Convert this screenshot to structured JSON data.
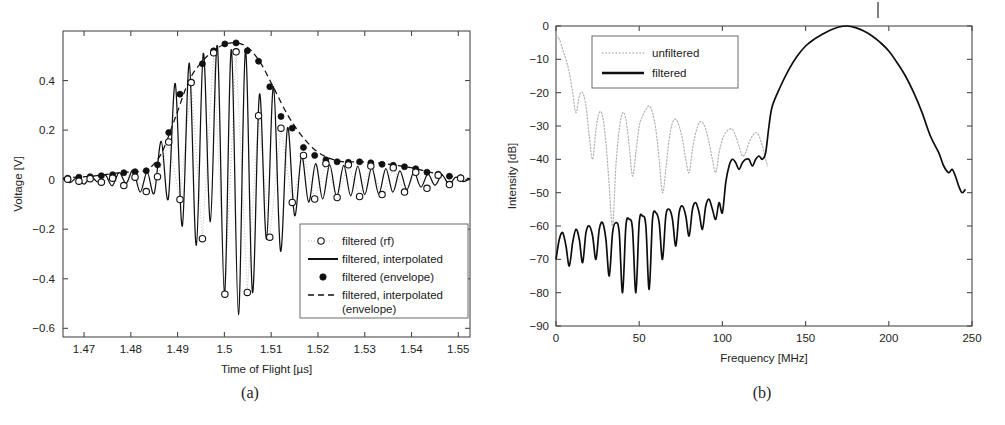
{
  "figure": {
    "panels": [
      {
        "id": "a",
        "caption": "(a)"
      },
      {
        "id": "b",
        "caption": "(b)"
      }
    ]
  },
  "panel_a": {
    "caption": "(a)",
    "xlabel": "Time of Flight [µs]",
    "ylabel": "Voltage [V]",
    "xticks": [
      "1.47",
      "1.48",
      "1.49",
      "1.5",
      "1.51",
      "1.52",
      "1.53",
      "1.54",
      "1.55"
    ],
    "yticks": [
      "0.4",
      "0.2",
      "0",
      "−0.2",
      "−0.4",
      "−0.6"
    ],
    "legend": {
      "items": [
        {
          "label": "filtered (rf)",
          "style": "dotted-with-open-circle"
        },
        {
          "label": "filtered, interpolated",
          "style": "solid"
        },
        {
          "label": "filtered (envelope)",
          "style": "filled-circle"
        },
        {
          "label": "filtered, interpolated",
          "style": "dashed"
        },
        {
          "label": "(envelope)",
          "style": "continuation"
        }
      ]
    }
  },
  "panel_b": {
    "caption": "(b)",
    "xlabel": "Frequency [MHz]",
    "ylabel": "Intensity [dB]",
    "xticks": [
      "0",
      "50",
      "100",
      "150",
      "200",
      "250"
    ],
    "yticks": [
      "0",
      "−10",
      "−20",
      "−30",
      "−40",
      "−50",
      "−60",
      "−70",
      "−80",
      "−90"
    ],
    "legend": {
      "items": [
        {
          "label": "unfiltered",
          "style": "dotted"
        },
        {
          "label": "filtered",
          "style": "solid"
        }
      ]
    }
  },
  "colors": {
    "ink": "#111111",
    "axis": "#4a4a4a",
    "dotted_gray": "#b0b0b0",
    "background": "#ffffff"
  },
  "chart_data": [
    {
      "type": "line",
      "panel": "a",
      "title": "",
      "xlabel": "Time of Flight [µs]",
      "ylabel": "Voltage [V]",
      "xlim": [
        1.4655,
        1.5525
      ],
      "ylim": [
        -0.635,
        0.6
      ],
      "xticks": [
        1.47,
        1.48,
        1.49,
        1.5,
        1.51,
        1.52,
        1.53,
        1.54,
        1.55
      ],
      "yticks": [
        0.4,
        0.2,
        0,
        -0.2,
        -0.4,
        -0.6
      ],
      "grid": false,
      "legend_position": "lower-right",
      "series": [
        {
          "name": "filtered, interpolated",
          "style": "solid",
          "comment": "densely sampled interpolated rf waveform: gaussian-windowed ~125 MHz tone centred at 1.5025 us",
          "x": [
            1.4655,
            1.467,
            1.4685,
            1.47,
            1.4715,
            1.473,
            1.4745,
            1.476,
            1.4775,
            1.479,
            1.4805,
            1.482,
            1.4835,
            1.485,
            1.4865,
            1.488,
            1.4895,
            1.491,
            1.4925,
            1.494,
            1.4955,
            1.497,
            1.4985,
            1.5,
            1.5015,
            1.503,
            1.5045,
            1.506,
            1.5075,
            1.509,
            1.5105,
            1.512,
            1.5135,
            1.515,
            1.5165,
            1.518,
            1.5195,
            1.521,
            1.5225,
            1.524,
            1.5255,
            1.527,
            1.5285,
            1.53,
            1.5315,
            1.533,
            1.5345,
            1.536,
            1.5375,
            1.539,
            1.5405,
            1.542,
            1.5435,
            1.545,
            1.5465,
            1.548,
            1.5495,
            1.551,
            1.5525
          ],
          "y": [
            0.005,
            -0.012,
            0.008,
            -0.018,
            0.012,
            -0.01,
            0.02,
            -0.025,
            0.028,
            -0.015,
            0.038,
            -0.05,
            0.03,
            -0.055,
            0.155,
            -0.078,
            0.388,
            -0.188,
            0.47,
            -0.265,
            0.51,
            -0.17,
            0.54,
            -0.46,
            0.525,
            -0.545,
            0.52,
            -0.455,
            0.345,
            -0.24,
            0.375,
            -0.288,
            0.21,
            -0.145,
            0.095,
            -0.09,
            0.065,
            -0.078,
            0.06,
            -0.07,
            0.058,
            -0.065,
            0.055,
            -0.06,
            0.05,
            -0.058,
            0.045,
            -0.05,
            0.035,
            -0.04,
            0.03,
            -0.03,
            0.022,
            -0.022,
            0.018,
            -0.018,
            0.01,
            -0.008,
            0.004
          ]
        },
        {
          "name": "filtered (rf)",
          "style": "open-circle-markers",
          "comment": "sparsely sampled rf points (open circles), ~every 2.4 ns",
          "x": [
            1.4665,
            1.4689,
            1.4713,
            1.4737,
            1.4761,
            1.4785,
            1.4809,
            1.4833,
            1.4857,
            1.4881,
            1.4905,
            1.4929,
            1.4953,
            1.4977,
            1.5001,
            1.5025,
            1.5049,
            1.5073,
            1.5097,
            1.5121,
            1.5145,
            1.5169,
            1.5193,
            1.5217,
            1.5241,
            1.5265,
            1.5289,
            1.5313,
            1.5337,
            1.5361,
            1.5385,
            1.5409,
            1.5433,
            1.5457,
            1.5481,
            1.5505
          ],
          "y": [
            0.002,
            -0.006,
            0.004,
            -0.01,
            0.006,
            -0.024,
            0.01,
            -0.048,
            0.012,
            0.152,
            -0.08,
            0.392,
            -0.238,
            0.512,
            -0.462,
            0.516,
            -0.455,
            0.258,
            -0.232,
            0.208,
            -0.092,
            0.098,
            -0.078,
            0.065,
            -0.072,
            0.06,
            -0.068,
            0.055,
            -0.06,
            0.048,
            -0.05,
            0.03,
            -0.035,
            0.018,
            -0.02,
            0.006
          ]
        },
        {
          "name": "filtered (envelope)",
          "style": "filled-circle-markers",
          "comment": "envelope sample points (filled dots)",
          "x": [
            1.4665,
            1.4689,
            1.4713,
            1.4737,
            1.4761,
            1.4785,
            1.4809,
            1.4833,
            1.4857,
            1.4881,
            1.4905,
            1.4929,
            1.4953,
            1.4977,
            1.5001,
            1.5025,
            1.5049,
            1.5073,
            1.5097,
            1.5121,
            1.5145,
            1.5169,
            1.5193,
            1.5217,
            1.5241,
            1.5265,
            1.5289,
            1.5313,
            1.5337,
            1.5361,
            1.5385,
            1.5409,
            1.5433,
            1.5457,
            1.5481,
            1.5505
          ],
          "y": [
            0.006,
            0.01,
            0.012,
            0.016,
            0.02,
            0.028,
            0.032,
            0.036,
            0.06,
            0.19,
            0.345,
            0.392,
            0.468,
            0.52,
            0.548,
            0.552,
            0.52,
            0.478,
            0.375,
            0.255,
            0.208,
            0.13,
            0.098,
            0.08,
            0.072,
            0.07,
            0.072,
            0.068,
            0.062,
            0.058,
            0.052,
            0.044,
            0.03,
            0.022,
            0.014,
            0.008
          ]
        },
        {
          "name": "filtered, interpolated (envelope)",
          "style": "dashed",
          "comment": "smooth interpolated envelope",
          "x": [
            1.4655,
            1.4685,
            1.4715,
            1.4745,
            1.4775,
            1.4805,
            1.4835,
            1.4865,
            1.4895,
            1.4925,
            1.4955,
            1.4985,
            1.5015,
            1.5045,
            1.5075,
            1.5105,
            1.5135,
            1.5165,
            1.5195,
            1.5225,
            1.5255,
            1.5285,
            1.5315,
            1.5345,
            1.5375,
            1.5405,
            1.5435,
            1.5465,
            1.5495,
            1.5525
          ],
          "y": [
            0.006,
            0.01,
            0.014,
            0.02,
            0.028,
            0.032,
            0.04,
            0.105,
            0.25,
            0.402,
            0.482,
            0.532,
            0.552,
            0.54,
            0.478,
            0.372,
            0.262,
            0.178,
            0.118,
            0.086,
            0.072,
            0.072,
            0.07,
            0.064,
            0.056,
            0.046,
            0.032,
            0.02,
            0.01,
            0.004
          ]
        }
      ]
    },
    {
      "type": "line",
      "panel": "b",
      "title": "",
      "xlabel": "Frequency [MHz]",
      "ylabel": "Intensity [dB]",
      "xlim": [
        0,
        250
      ],
      "ylim": [
        -90,
        0
      ],
      "xticks": [
        0,
        50,
        100,
        150,
        200,
        250
      ],
      "yticks": [
        0,
        -10,
        -20,
        -30,
        -40,
        -50,
        -60,
        -70,
        -80,
        -90
      ],
      "grid": false,
      "legend_position": "upper-left",
      "series": [
        {
          "name": "unfiltered",
          "style": "dotted",
          "comment": "unfiltered spectrum: starts ~-3 dB at DC, falls steeply, sidelobe plateau -25 to -40 dB, truncated at ~127 MHz",
          "x": [
            0,
            2,
            4,
            6,
            8,
            10,
            12,
            14,
            16,
            18,
            20,
            22,
            24,
            26,
            28,
            30,
            32,
            34,
            36,
            38,
            40,
            42,
            44,
            46,
            48,
            50,
            52,
            54,
            56,
            58,
            60,
            62,
            64,
            66,
            68,
            70,
            72,
            74,
            76,
            78,
            80,
            82,
            84,
            86,
            88,
            90,
            92,
            94,
            96,
            98,
            100,
            102,
            104,
            106,
            108,
            110,
            112,
            114,
            116,
            118,
            120,
            122,
            124,
            126,
            127
          ],
          "y": [
            -3,
            -4,
            -7,
            -10,
            -14,
            -20,
            -26,
            -21,
            -20,
            -24,
            -33,
            -40,
            -31,
            -26,
            -27,
            -35,
            -48,
            -60,
            -42,
            -31,
            -26,
            -28,
            -36,
            -45,
            -38,
            -30,
            -27,
            -25,
            -24,
            -26,
            -31,
            -40,
            -50,
            -43,
            -34,
            -29,
            -28,
            -30,
            -34,
            -40,
            -44,
            -37,
            -32,
            -29,
            -29,
            -31,
            -35,
            -40,
            -44,
            -38,
            -34,
            -32,
            -31,
            -31,
            -33,
            -36,
            -39,
            -38,
            -35,
            -33,
            -32,
            -33,
            -36,
            -40,
            -42
          ]
        },
        {
          "name": "filtered",
          "style": "solid",
          "comment": "band-pass filtered spectrum: rippled stop-band floor rising from -62 dB at DC to -40 dB near 120 MHz, main lobe peaks at 0 dB at ~175 MHz, rolls off to about -50 dB at 245 MHz",
          "x": [
            0,
            2,
            4,
            6,
            8,
            10,
            12,
            14,
            16,
            18,
            20,
            22,
            24,
            26,
            28,
            30,
            32,
            34,
            36,
            38,
            40,
            42,
            44,
            46,
            48,
            50,
            52,
            54,
            56,
            58,
            60,
            62,
            64,
            66,
            68,
            70,
            72,
            74,
            76,
            78,
            80,
            82,
            84,
            86,
            88,
            90,
            92,
            94,
            96,
            98,
            100,
            102,
            104,
            106,
            108,
            110,
            112,
            114,
            116,
            118,
            120,
            122,
            124,
            126,
            128,
            130,
            135,
            140,
            145,
            150,
            155,
            160,
            165,
            170,
            175,
            180,
            185,
            190,
            195,
            200,
            205,
            210,
            215,
            220,
            225,
            230,
            233,
            236,
            238,
            240,
            242,
            244,
            246,
            248,
            250
          ],
          "y": [
            -70,
            -64,
            -62,
            -66,
            -72,
            -65,
            -61,
            -64,
            -71,
            -62,
            -60,
            -63,
            -70,
            -61,
            -59,
            -64,
            -75,
            -62,
            -59,
            -62,
            -80,
            -60,
            -58,
            -61,
            -80,
            -59,
            -57,
            -60,
            -79,
            -58,
            -56,
            -59,
            -70,
            -57,
            -55,
            -58,
            -66,
            -56,
            -54,
            -57,
            -63,
            -55,
            -53,
            -56,
            -61,
            -54,
            -52,
            -55,
            -58,
            -53,
            -56,
            -47,
            -42,
            -40,
            -41,
            -43,
            -41,
            -40,
            -40,
            -42,
            -40,
            -39,
            -40,
            -38,
            -30,
            -24,
            -18,
            -13,
            -9,
            -6,
            -4,
            -2.5,
            -1.2,
            -0.3,
            0,
            -0.5,
            -1.5,
            -3,
            -5,
            -7.5,
            -11,
            -15,
            -20,
            -26,
            -33,
            -38,
            -42,
            -44,
            -43,
            -45,
            -48,
            -50,
            -49,
            -47
          ]
        }
      ]
    }
  ]
}
